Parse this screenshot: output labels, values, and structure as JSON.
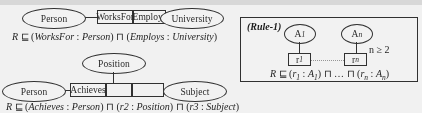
{
  "figure": {
    "background_color": "#fdfdfd",
    "stroke_color": "#2b2b2b"
  },
  "diagram_one": {
    "name": "works-for-employs-diagram",
    "left_entity": "Person",
    "role_box_left": "WorksFor",
    "role_box_right": "Employs",
    "right_entity": "University",
    "axiom": {
      "subject": "R",
      "symbol": "⊑",
      "conjunct_one_role": "WorksFor",
      "conjunct_one_concept": "Person",
      "connective": "⊓",
      "conjunct_two_role": "Employs",
      "conjunct_two_concept": "University"
    }
  },
  "diagram_two": {
    "name": "achieves-diagram",
    "top_entity": "Position",
    "left_entity": "Person",
    "role_box_first": "Achieves",
    "role_box_second": "",
    "role_box_third": "",
    "right_entity": "Subject",
    "axiom": {
      "subject": "R",
      "symbol": "⊑",
      "conjunct_one_role": "Achieves",
      "conjunct_one_concept": "Person",
      "connective": "⊓",
      "conjunct_two_role": "r2",
      "conjunct_two_concept": "Position",
      "conjunct_three_role": "r3",
      "conjunct_three_concept": "Subject"
    }
  },
  "rule_panel": {
    "name": "rule-1-panel",
    "title": "(Rule-1)",
    "entity_first": "A",
    "entity_first_sub": "1",
    "entity_last": "A",
    "entity_last_sub": "n",
    "role_first": "r",
    "role_first_sub": "1",
    "role_last": "r",
    "role_last_sub": "n",
    "condition": "n ≥ 2",
    "axiom": {
      "subject": "R",
      "symbol": "⊑",
      "open_one": "(",
      "role_one": "r",
      "role_one_sub": "1",
      "colon": " : ",
      "concept_one": "A",
      "concept_one_sub": "1",
      "close_one": ")",
      "connective": "⊓",
      "ellipsis": "…",
      "connective_two": "⊓",
      "open_two": "(",
      "role_n": "r",
      "role_n_sub": "n",
      "concept_n": "A",
      "concept_n_sub": "n",
      "close_two": ")"
    }
  }
}
